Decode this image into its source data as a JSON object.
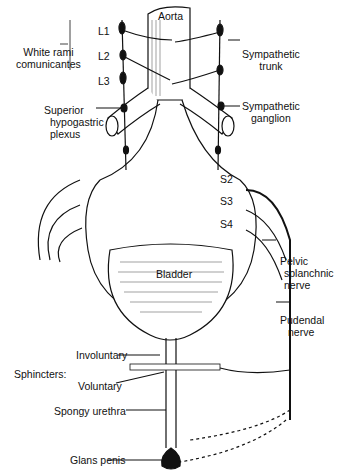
{
  "diagram": {
    "labels": {
      "aorta": "Aorta",
      "l1": "L1",
      "l2": "L2",
      "l3": "L3",
      "white_rami_1": "White rami",
      "white_rami_2": "comunicantes",
      "sympathetic_trunk_1": "Sympathetic",
      "sympathetic_trunk_2": "trunk",
      "superior_hypogastric_1": "Superior",
      "superior_hypogastric_2": "hypogastric",
      "superior_hypogastric_3": "plexus",
      "sympathetic_ganglion_1": "Sympathetic",
      "sympathetic_ganglion_2": "ganglion",
      "s2": "S2",
      "s3": "S3",
      "s4": "S4",
      "bladder": "Bladder",
      "pelvic_splanchnic_1": "Pelvic",
      "pelvic_splanchnic_2": "splanchnic",
      "pelvic_splanchnic_3": "nerve",
      "pudendal_1": "Pudendal",
      "pudendal_2": "nerve",
      "sphincters": "Sphincters:",
      "involuntary": "Involuntary",
      "voluntary": "Voluntary",
      "spongy_urethra": "Spongy urethra",
      "glans_penis": "Glans penis"
    },
    "colors": {
      "ink": "#111111",
      "background": "#ffffff"
    }
  }
}
